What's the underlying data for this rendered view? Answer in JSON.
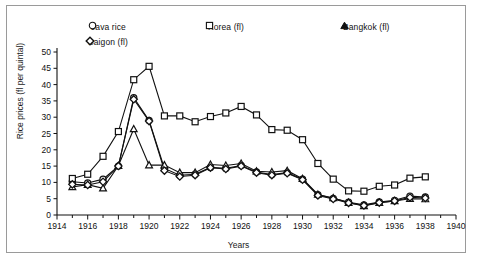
{
  "chart_data": {
    "type": "line",
    "title": "",
    "xlabel": "Years",
    "ylabel": "Rice prices (fl per quintal)",
    "xlim": [
      1914,
      1940
    ],
    "ylim": [
      0,
      50
    ],
    "ytick_step": 5,
    "xtick_step": 2,
    "xminor_step": 1,
    "grid": false,
    "legend_position": "top",
    "yticks": [
      "0",
      "5",
      "10",
      "15",
      "20",
      "25",
      "30",
      "35",
      "40",
      "45",
      "50"
    ],
    "xticks": [
      "1914",
      "1916",
      "1918",
      "1920",
      "1922",
      "1924",
      "1926",
      "1928",
      "1930",
      "1932",
      "1934",
      "1936",
      "1938",
      "1940"
    ],
    "x": [
      1915,
      1916,
      1917,
      1918,
      1919,
      1920,
      1921,
      1922,
      1923,
      1924,
      1925,
      1926,
      1927,
      1928,
      1929,
      1930,
      1931,
      1932,
      1933,
      1934,
      1935,
      1936,
      1937,
      1938
    ],
    "series": [
      {
        "name": "Java rice",
        "marker": "circle",
        "values": [
          10.2,
          9.8,
          11.0,
          15.0,
          36.0,
          29.0,
          14.3,
          12.2,
          12.5,
          14.6,
          14.3,
          15.2,
          13.2,
          12.4,
          13.0,
          11.0,
          6.2,
          5.1,
          3.9,
          3.1,
          4.0,
          4.5,
          5.8,
          5.5
        ]
      },
      {
        "name": "Korea (fl)",
        "marker": "square",
        "values": [
          11.2,
          12.5,
          18.0,
          25.6,
          41.5,
          45.6,
          30.4,
          30.4,
          28.6,
          30.2,
          31.3,
          33.3,
          30.7,
          26.2,
          26.0,
          23.1,
          15.8,
          11.0,
          7.4,
          7.3,
          8.8,
          9.2,
          11.3,
          11.7
        ]
      },
      {
        "name": "Bangkok (fl)",
        "marker": "triangle",
        "values": [
          8.6,
          9.3,
          8.2,
          15.1,
          26.4,
          15.3,
          15.3,
          13.0,
          13.0,
          15.5,
          15.2,
          15.8,
          13.4,
          13.2,
          13.6,
          11.1,
          6.3,
          5.2,
          3.8,
          2.8,
          3.8,
          4.3,
          5.0,
          4.9
        ]
      },
      {
        "name": "Saigon (fl)",
        "marker": "diamond",
        "values": [
          9.4,
          9.2,
          10.2,
          15.0,
          35.5,
          28.8,
          13.6,
          11.8,
          12.2,
          14.5,
          14.1,
          15.0,
          13.0,
          12.2,
          12.8,
          10.8,
          6.0,
          4.9,
          3.7,
          2.9,
          3.8,
          4.3,
          5.4,
          5.2
        ]
      }
    ]
  },
  "legend": {
    "java": "Java  rice",
    "saigon": "Saigon  (fl)",
    "korea": "Korea  (fl)",
    "bangkok": "Bangkok  (fl)"
  },
  "axes": {
    "ylabel": "Rice prices (fl per quintal)",
    "xlabel": "Years"
  }
}
